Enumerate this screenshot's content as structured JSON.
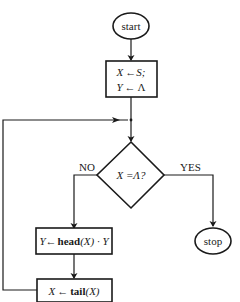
{
  "diagram": {
    "type": "flowchart",
    "nodes": {
      "start": {
        "shape": "ellipse",
        "label": "start"
      },
      "init": {
        "shape": "rectangle",
        "line1": {
          "var": "X",
          "arrow": "←",
          "val": "S;"
        },
        "line2": {
          "var": "Y",
          "arrow": "←",
          "val": "Λ"
        }
      },
      "decision": {
        "shape": "diamond",
        "label": "X =Λ?"
      },
      "head": {
        "shape": "rectangle",
        "var": "Y",
        "arrow": "←",
        "func": "head",
        "arg": "(X)",
        "rest": " · Y"
      },
      "tail": {
        "shape": "rectangle",
        "var": "X",
        "arrow": "←",
        "func": "tail",
        "arg": "(X)"
      },
      "stop": {
        "shape": "ellipse",
        "label": "stop"
      }
    },
    "edges": {
      "no_label": "NO",
      "yes_label": "YES"
    },
    "colors": {
      "stroke": "#1a1a1a",
      "background": "#ffffff"
    }
  }
}
